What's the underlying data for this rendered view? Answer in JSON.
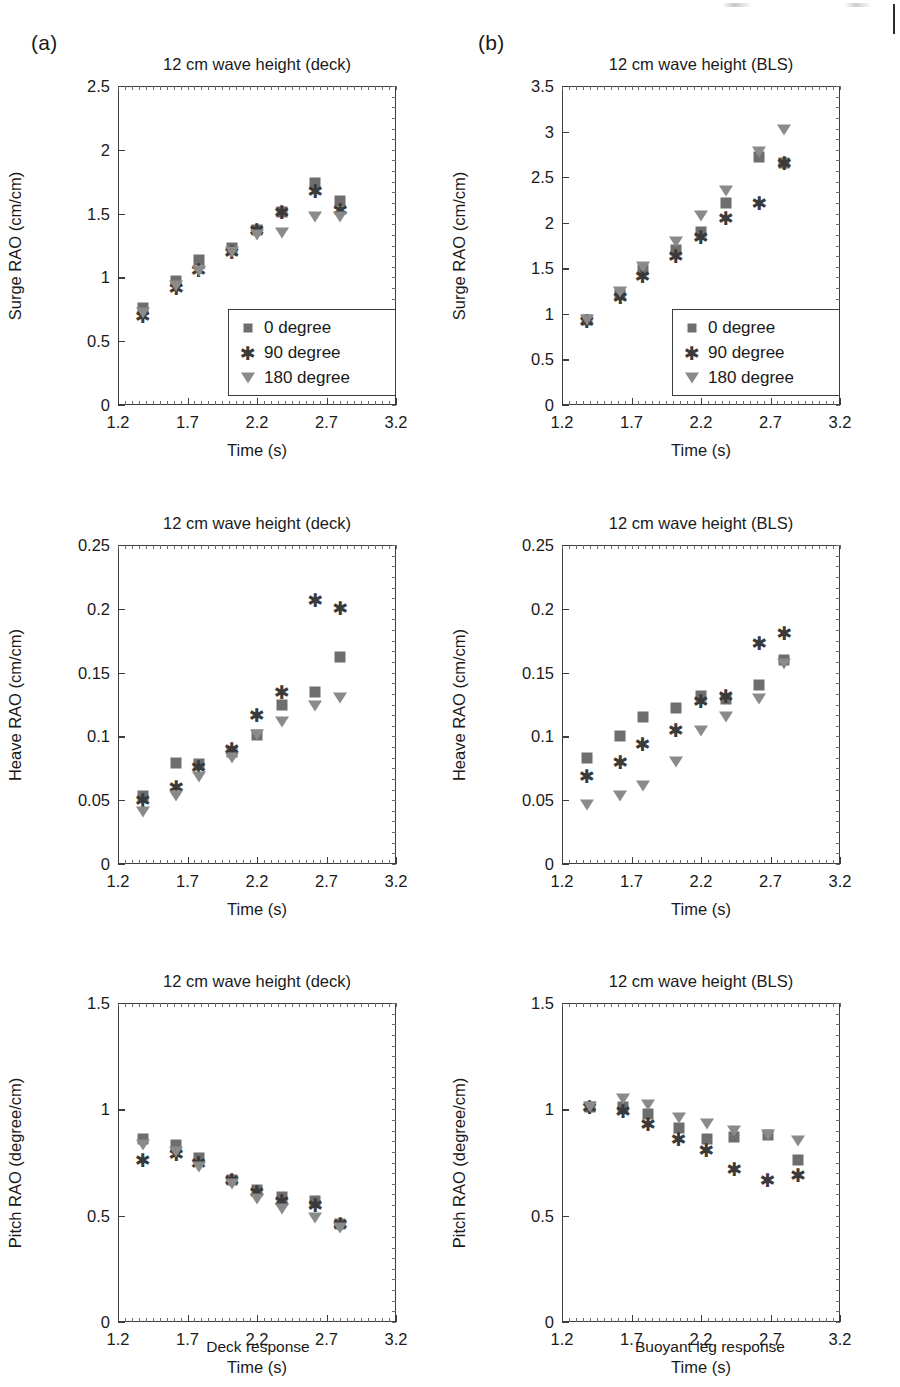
{
  "figure": {
    "panel_a_tag": "(a)",
    "panel_b_tag": "(b)",
    "left_caption": "Deck response",
    "right_caption": "Buoyant leg response",
    "marker_colors": {
      "series_0": "#6e6e6e",
      "series_90": "#3a3a3a",
      "series_180": "#8a8a8a"
    },
    "legend_labels": [
      "0 degree",
      "90 degree",
      "180 degree"
    ]
  },
  "chart_data": [
    {
      "id": "surge-deck",
      "type": "scatter",
      "title": "12 cm wave height (deck)",
      "xlabel": "Time (s)",
      "ylabel": "Surge RAO (cm/cm)",
      "xlim": [
        1.2,
        3.2
      ],
      "ylim": [
        0,
        2.5
      ],
      "xticks": [
        1.2,
        1.7,
        2.2,
        2.7,
        3.2
      ],
      "xtick_labels": [
        "1.2",
        "1.7",
        "2.2",
        "2.7",
        "3.2"
      ],
      "yticks": [
        0,
        0.5,
        1,
        1.5,
        2,
        2.5
      ],
      "ytick_labels": [
        "0",
        "0.5",
        "1",
        "1.5",
        "2",
        "2.5"
      ],
      "grid": false,
      "legend_position": "lower-right",
      "x": [
        1.38,
        1.62,
        1.78,
        2.02,
        2.2,
        2.38,
        2.62,
        2.8
      ],
      "series": [
        {
          "name": "0 degree",
          "marker": "square",
          "values": [
            0.76,
            0.97,
            1.14,
            1.23,
            1.37,
            1.51,
            1.74,
            1.6
          ]
        },
        {
          "name": "90 degree",
          "marker": "star",
          "values": [
            0.7,
            0.92,
            1.06,
            1.2,
            1.37,
            1.51,
            1.68,
            1.53
          ]
        },
        {
          "name": "180 degree",
          "marker": "triangle-down",
          "values": [
            0.72,
            0.93,
            1.05,
            1.2,
            1.33,
            1.35,
            1.47,
            1.47
          ]
        }
      ]
    },
    {
      "id": "surge-bls",
      "type": "scatter",
      "title": "12 cm wave height (BLS)",
      "xlabel": "Time (s)",
      "ylabel": "Surge RAO (cm/cm)",
      "xlim": [
        1.2,
        3.2
      ],
      "ylim": [
        0,
        3.5
      ],
      "xticks": [
        1.2,
        1.7,
        2.2,
        2.7,
        3.2
      ],
      "xtick_labels": [
        "1.2",
        "1.7",
        "2.2",
        "2.7",
        "3.2"
      ],
      "yticks": [
        0,
        0.5,
        1,
        1.5,
        2,
        2.5,
        3,
        3.5
      ],
      "ytick_labels": [
        "0",
        "0.5",
        "1",
        "1.5",
        "2",
        "2.5",
        "3",
        "3.5"
      ],
      "grid": false,
      "legend_position": "lower-right",
      "x": [
        1.38,
        1.62,
        1.78,
        2.02,
        2.2,
        2.38,
        2.62,
        2.8
      ],
      "series": [
        {
          "name": "0 degree",
          "marker": "square",
          "values": [
            0.93,
            1.22,
            1.48,
            1.7,
            1.9,
            2.22,
            2.72,
            2.65
          ]
        },
        {
          "name": "90 degree",
          "marker": "star",
          "values": [
            0.92,
            1.19,
            1.42,
            1.63,
            1.84,
            2.05,
            2.22,
            2.65
          ]
        },
        {
          "name": "180 degree",
          "marker": "triangle-down",
          "values": [
            0.93,
            1.24,
            1.51,
            1.79,
            2.07,
            2.35,
            2.78,
            3.02
          ]
        }
      ]
    },
    {
      "id": "heave-deck",
      "type": "scatter",
      "title": "12 cm wave height (deck)",
      "xlabel": "Time (s)",
      "ylabel": "Heave RAO (cm/cm)",
      "xlim": [
        1.2,
        3.2
      ],
      "ylim": [
        0,
        0.25
      ],
      "xticks": [
        1.2,
        1.7,
        2.2,
        2.7,
        3.2
      ],
      "xtick_labels": [
        "1.2",
        "1.7",
        "2.2",
        "2.7",
        "3.2"
      ],
      "yticks": [
        0,
        0.05,
        0.1,
        0.15,
        0.2,
        0.25
      ],
      "ytick_labels": [
        "0",
        "0.05",
        "0.1",
        "0.15",
        "0.2",
        "0.25"
      ],
      "grid": false,
      "legend_position": "none",
      "x": [
        1.38,
        1.62,
        1.78,
        2.02,
        2.2,
        2.38,
        2.62,
        2.8
      ],
      "series": [
        {
          "name": "0 degree",
          "marker": "square",
          "values": [
            0.053,
            0.079,
            0.078,
            0.088,
            0.101,
            0.125,
            0.135,
            0.162
          ]
        },
        {
          "name": "90 degree",
          "marker": "star",
          "values": [
            0.05,
            0.06,
            0.076,
            0.09,
            0.117,
            0.135,
            0.207,
            0.201
          ]
        },
        {
          "name": "180 degree",
          "marker": "triangle-down",
          "values": [
            0.041,
            0.053,
            0.068,
            0.083,
            0.101,
            0.111,
            0.124,
            0.13
          ]
        }
      ]
    },
    {
      "id": "heave-bls",
      "type": "scatter",
      "title": "12 cm wave height (BLS)",
      "xlabel": "Time (s)",
      "ylabel": "Heave RAO (cm/cm)",
      "xlim": [
        1.2,
        3.2
      ],
      "ylim": [
        0,
        0.25
      ],
      "xticks": [
        1.2,
        1.7,
        2.2,
        2.7,
        3.2
      ],
      "xtick_labels": [
        "1.2",
        "1.7",
        "2.2",
        "2.7",
        "3.2"
      ],
      "yticks": [
        0,
        0.05,
        0.1,
        0.15,
        0.2,
        0.25
      ],
      "ytick_labels": [
        "0",
        "0.05",
        "0.1",
        "0.15",
        "0.2",
        "0.25"
      ],
      "grid": false,
      "legend_position": "none",
      "x": [
        1.38,
        1.62,
        1.78,
        2.02,
        2.2,
        2.38,
        2.62,
        2.8
      ],
      "series": [
        {
          "name": "0 degree",
          "marker": "square",
          "values": [
            0.083,
            0.1,
            0.115,
            0.122,
            0.132,
            0.129,
            0.14,
            0.16
          ]
        },
        {
          "name": "90 degree",
          "marker": "star",
          "values": [
            0.069,
            0.08,
            0.094,
            0.105,
            0.128,
            0.132,
            0.173,
            0.181
          ]
        },
        {
          "name": "180 degree",
          "marker": "triangle-down",
          "values": [
            0.046,
            0.053,
            0.061,
            0.08,
            0.104,
            0.115,
            0.129,
            0.157
          ]
        }
      ]
    },
    {
      "id": "pitch-deck",
      "type": "scatter",
      "title": "12 cm wave height (deck)",
      "xlabel": "Time (s)",
      "ylabel": "Pitch RAO (degree/cm)",
      "xlim": [
        1.2,
        3.2
      ],
      "ylim": [
        0,
        1.5
      ],
      "xticks": [
        1.2,
        1.7,
        2.2,
        2.7,
        3.2
      ],
      "xtick_labels": [
        "1.2",
        "1.7",
        "2.2",
        "2.7",
        "3.2"
      ],
      "yticks": [
        0,
        0.5,
        1,
        1.5
      ],
      "ytick_labels": [
        "0",
        "0.5",
        "1",
        "1.5"
      ],
      "grid": false,
      "legend_position": "none",
      "x": [
        1.38,
        1.62,
        1.78,
        2.02,
        2.2,
        2.38,
        2.62,
        2.8
      ],
      "series": [
        {
          "name": "0 degree",
          "marker": "square",
          "values": [
            0.86,
            0.83,
            0.77,
            0.67,
            0.62,
            0.59,
            0.57,
            0.46
          ]
        },
        {
          "name": "90 degree",
          "marker": "star",
          "values": [
            0.76,
            0.79,
            0.75,
            0.67,
            0.61,
            0.57,
            0.55,
            0.46
          ]
        },
        {
          "name": "180 degree",
          "marker": "triangle-down",
          "values": [
            0.83,
            0.8,
            0.73,
            0.65,
            0.58,
            0.53,
            0.49,
            0.44
          ]
        }
      ]
    },
    {
      "id": "pitch-bls",
      "type": "scatter",
      "title": "12 cm wave height (BLS)",
      "xlabel": "Time (s)",
      "ylabel": "Pitch RAO (degree/cm)",
      "xlim": [
        1.2,
        3.2
      ],
      "ylim": [
        0,
        1.5
      ],
      "xticks": [
        1.2,
        1.7,
        2.2,
        2.7,
        3.2
      ],
      "xtick_labels": [
        "1.2",
        "1.7",
        "2.2",
        "2.7",
        "3.2"
      ],
      "yticks": [
        0,
        0.5,
        1,
        1.5
      ],
      "ytick_labels": [
        "0",
        "0.5",
        "1",
        "1.5"
      ],
      "grid": false,
      "legend_position": "none",
      "x": [
        1.4,
        1.64,
        1.82,
        2.04,
        2.24,
        2.44,
        2.68,
        2.9
      ],
      "series": [
        {
          "name": "0 degree",
          "marker": "square",
          "values": [
            1.01,
            1.01,
            0.98,
            0.91,
            0.86,
            0.87,
            0.88,
            0.76
          ]
        },
        {
          "name": "90 degree",
          "marker": "star",
          "values": [
            1.01,
            0.99,
            0.93,
            0.86,
            0.81,
            0.72,
            0.67,
            0.69
          ]
        },
        {
          "name": "180 degree",
          "marker": "triangle-down",
          "values": [
            1.01,
            1.05,
            1.02,
            0.96,
            0.93,
            0.9,
            0.88,
            0.85
          ]
        }
      ]
    }
  ]
}
